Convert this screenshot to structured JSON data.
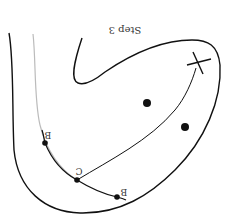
{
  "diagram": {
    "orientation": "rotated-180",
    "title": "Step 3",
    "labels": {
      "b_upper": "B",
      "c_middle": "C",
      "b_lower": "B"
    },
    "markers": {
      "target": "X",
      "dots_count": 2
    },
    "colors": {
      "stroke": "#111111",
      "faint_stroke": "#bbbbbb",
      "background": "#ffffff"
    }
  }
}
